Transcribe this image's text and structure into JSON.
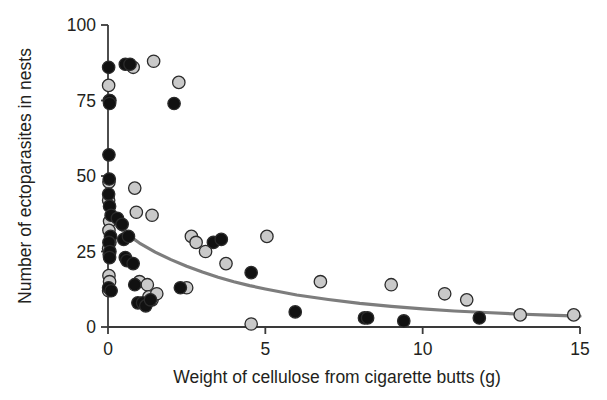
{
  "chart_data": {
    "type": "scatter",
    "title": "",
    "xlabel": "Weight of cellulose from cigarette butts (g)",
    "ylabel": "Number of ectoparasites in nests",
    "xlim": [
      0,
      15
    ],
    "ylim": [
      0,
      100
    ],
    "xticks": [
      0,
      5,
      10,
      15
    ],
    "yticks": [
      0,
      25,
      50,
      75,
      100
    ],
    "xtick_labels": [
      "0",
      "5",
      "10",
      "15"
    ],
    "ytick_labels": [
      "0",
      "25",
      "50",
      "75",
      "100"
    ],
    "grid": false,
    "legend": "none",
    "colors": {
      "marker_dark": "#111111",
      "marker_light": "#c9c9c9",
      "marker_edge": "#2b2b2b",
      "trendline": "#7d7d7d",
      "axis": "#3a3a3a",
      "text": "#231f20",
      "background": "#ffffff"
    },
    "series": [
      {
        "name": "dark-filled nests",
        "marker": "filled-circle",
        "color": "#111111",
        "points": [
          [
            0.02,
            86
          ],
          [
            0.06,
            75
          ],
          [
            0.05,
            74
          ],
          [
            0.03,
            57
          ],
          [
            0.04,
            49
          ],
          [
            0.02,
            44
          ],
          [
            0.05,
            40
          ],
          [
            0.1,
            37
          ],
          [
            0.08,
            30
          ],
          [
            0.03,
            28
          ],
          [
            0.06,
            25
          ],
          [
            0.05,
            23
          ],
          [
            0.02,
            13
          ],
          [
            0.1,
            12
          ],
          [
            0.3,
            36
          ],
          [
            0.55,
            87
          ],
          [
            0.7,
            87
          ],
          [
            0.45,
            34
          ],
          [
            0.5,
            29
          ],
          [
            0.55,
            23
          ],
          [
            0.6,
            22
          ],
          [
            0.65,
            30
          ],
          [
            0.8,
            21
          ],
          [
            0.85,
            14
          ],
          [
            0.95,
            8
          ],
          [
            1.1,
            8
          ],
          [
            1.2,
            7
          ],
          [
            1.35,
            9
          ],
          [
            2.1,
            74
          ],
          [
            2.3,
            13
          ],
          [
            3.35,
            28
          ],
          [
            3.6,
            29
          ],
          [
            4.55,
            18
          ],
          [
            5.95,
            5
          ],
          [
            8.15,
            3
          ],
          [
            8.25,
            3
          ],
          [
            9.4,
            2
          ],
          [
            11.8,
            3
          ]
        ]
      },
      {
        "name": "light-filled nests",
        "marker": "open-circle",
        "color": "#c9c9c9",
        "points": [
          [
            0.02,
            80
          ],
          [
            0.04,
            75
          ],
          [
            0.03,
            48
          ],
          [
            0.02,
            42
          ],
          [
            0.05,
            35
          ],
          [
            0.03,
            32
          ],
          [
            0.06,
            28
          ],
          [
            0.02,
            26
          ],
          [
            0.04,
            24
          ],
          [
            0.03,
            17
          ],
          [
            0.05,
            15
          ],
          [
            0.02,
            12
          ],
          [
            0.8,
            86
          ],
          [
            1.45,
            88
          ],
          [
            2.25,
            81
          ],
          [
            0.85,
            46
          ],
          [
            0.9,
            38
          ],
          [
            1.4,
            37
          ],
          [
            1.0,
            15
          ],
          [
            1.25,
            14
          ],
          [
            1.3,
            10
          ],
          [
            1.4,
            9
          ],
          [
            1.55,
            11
          ],
          [
            2.65,
            30
          ],
          [
            2.8,
            28
          ],
          [
            2.5,
            13
          ],
          [
            3.1,
            25
          ],
          [
            3.75,
            21
          ],
          [
            4.55,
            1
          ],
          [
            5.05,
            30
          ],
          [
            6.75,
            15
          ],
          [
            9.0,
            14
          ],
          [
            10.7,
            11
          ],
          [
            11.4,
            9
          ],
          [
            13.1,
            4
          ],
          [
            14.8,
            4
          ]
        ]
      }
    ],
    "trendline": {
      "name": "fitted decay curve",
      "type": "exponential-decay",
      "description": "Smooth negative exponential fit through the scatter",
      "points": [
        [
          0.0,
          36.0
        ],
        [
          0.5,
          31.5
        ],
        [
          1.0,
          27.8
        ],
        [
          1.5,
          24.8
        ],
        [
          2.0,
          22.3
        ],
        [
          2.5,
          20.1
        ],
        [
          3.0,
          18.2
        ],
        [
          3.5,
          16.5
        ],
        [
          4.0,
          15.0
        ],
        [
          4.5,
          13.7
        ],
        [
          5.0,
          12.6
        ],
        [
          6.0,
          10.6
        ],
        [
          7.0,
          9.1
        ],
        [
          8.0,
          7.8
        ],
        [
          9.0,
          6.8
        ],
        [
          10.0,
          6.0
        ],
        [
          11.0,
          5.3
        ],
        [
          12.0,
          4.8
        ],
        [
          13.0,
          4.3
        ],
        [
          14.0,
          3.9
        ],
        [
          15.0,
          3.6
        ]
      ]
    }
  }
}
